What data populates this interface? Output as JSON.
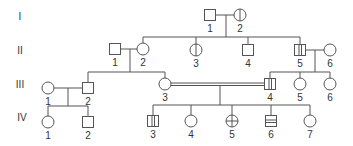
{
  "colors": {
    "line": "#555555",
    "fill": "#ffffff",
    "text": "#333333"
  },
  "generations": [
    {
      "label": "I",
      "y": 16
    },
    {
      "label": "II",
      "y": 50
    },
    {
      "label": "III",
      "y": 84
    },
    {
      "label": "IV",
      "y": 121
    }
  ],
  "individuals": [
    {
      "id": "I-1",
      "gen": "I",
      "num": "1",
      "sex": "male",
      "marking": "none",
      "x": 210,
      "y": 15
    },
    {
      "id": "I-2",
      "gen": "I",
      "num": "2",
      "sex": "female",
      "marking": "vertical-line",
      "x": 240,
      "y": 15
    },
    {
      "id": "II-1",
      "gen": "II",
      "num": "1",
      "sex": "male",
      "marking": "none",
      "x": 115,
      "y": 49
    },
    {
      "id": "II-2",
      "gen": "II",
      "num": "2",
      "sex": "female",
      "marking": "none",
      "x": 143,
      "y": 49
    },
    {
      "id": "II-3",
      "gen": "II",
      "num": "3",
      "sex": "female",
      "marking": "vertical-line",
      "x": 196,
      "y": 50
    },
    {
      "id": "II-4",
      "gen": "II",
      "num": "4",
      "sex": "male",
      "marking": "none",
      "x": 248,
      "y": 50
    },
    {
      "id": "II-5",
      "gen": "II",
      "num": "5",
      "sex": "male",
      "marking": "vertical-stripe",
      "x": 300,
      "y": 50
    },
    {
      "id": "II-6",
      "gen": "II",
      "num": "6",
      "sex": "female",
      "marking": "none",
      "x": 330,
      "y": 50
    },
    {
      "id": "III-1",
      "gen": "III",
      "num": "1",
      "sex": "female",
      "marking": "none",
      "x": 48,
      "y": 88
    },
    {
      "id": "III-2",
      "gen": "III",
      "num": "2",
      "sex": "male",
      "marking": "none",
      "x": 88,
      "y": 88
    },
    {
      "id": "III-3",
      "gen": "III",
      "num": "3",
      "sex": "female",
      "marking": "none",
      "x": 165,
      "y": 84
    },
    {
      "id": "III-4",
      "gen": "III",
      "num": "4",
      "sex": "male",
      "marking": "vertical-stripe",
      "x": 270,
      "y": 84
    },
    {
      "id": "III-5",
      "gen": "III",
      "num": "5",
      "sex": "female",
      "marking": "none",
      "x": 300,
      "y": 84
    },
    {
      "id": "III-6",
      "gen": "III",
      "num": "6",
      "sex": "female",
      "marking": "none",
      "x": 330,
      "y": 84
    },
    {
      "id": "IV-1",
      "gen": "IV",
      "num": "1",
      "sex": "female",
      "marking": "none",
      "x": 48,
      "y": 122
    },
    {
      "id": "IV-2",
      "gen": "IV",
      "num": "2",
      "sex": "male",
      "marking": "none",
      "x": 88,
      "y": 122
    },
    {
      "id": "IV-3",
      "gen": "IV",
      "num": "3",
      "sex": "male",
      "marking": "vertical-stripe",
      "x": 153,
      "y": 121
    },
    {
      "id": "IV-4",
      "gen": "IV",
      "num": "4",
      "sex": "female",
      "marking": "none",
      "x": 191,
      "y": 121
    },
    {
      "id": "IV-5",
      "gen": "IV",
      "num": "5",
      "sex": "female",
      "marking": "cross",
      "x": 232,
      "y": 121
    },
    {
      "id": "IV-6",
      "gen": "IV",
      "num": "6",
      "sex": "male",
      "marking": "horizontal-stripe",
      "x": 271,
      "y": 121
    },
    {
      "id": "IV-7",
      "gen": "IV",
      "num": "7",
      "sex": "female",
      "marking": "none",
      "x": 310,
      "y": 121
    }
  ],
  "matings": [
    {
      "partners": [
        "I-1",
        "I-2"
      ],
      "consanguineous": false
    },
    {
      "partners": [
        "II-1",
        "II-2"
      ],
      "consanguineous": false
    },
    {
      "partners": [
        "II-5",
        "II-6"
      ],
      "consanguineous": false
    },
    {
      "partners": [
        "III-1",
        "III-2"
      ],
      "consanguineous": false
    },
    {
      "partners": [
        "III-3",
        "III-4"
      ],
      "consanguineous": true
    }
  ]
}
